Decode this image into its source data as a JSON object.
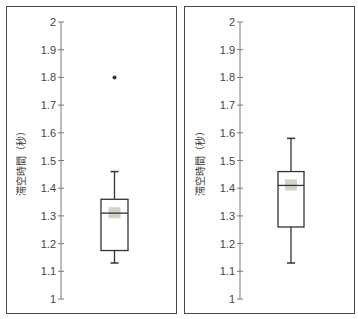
{
  "chart_data": [
    {
      "type": "box",
      "title": "",
      "xlabel": "",
      "ylabel": "滞空時間（秒）",
      "ylim": [
        1,
        2
      ],
      "yticks": [
        "1",
        "1.1",
        "1.2",
        "1.3",
        "1.4",
        "1.5",
        "1.6",
        "1.7",
        "1.8",
        "1.9",
        "2"
      ],
      "grid": false,
      "box": {
        "whisker_low": 1.13,
        "q1": 1.175,
        "median": 1.31,
        "mean": 1.31,
        "q3": 1.36,
        "whisker_high": 1.46,
        "outliers": [
          1.8
        ]
      }
    },
    {
      "type": "box",
      "title": "",
      "xlabel": "",
      "ylabel": "滞空時間（秒）",
      "ylim": [
        1,
        2
      ],
      "yticks": [
        "1",
        "1.1",
        "1.2",
        "1.3",
        "1.4",
        "1.5",
        "1.6",
        "1.7",
        "1.8",
        "1.9",
        "2"
      ],
      "grid": false,
      "box": {
        "whisker_low": 1.13,
        "q1": 1.26,
        "median": 1.41,
        "mean": 1.41,
        "q3": 1.46,
        "whisker_high": 1.58,
        "outliers": []
      }
    }
  ],
  "colors": {
    "axis": "#7a7a7a",
    "box_stroke": "#333333",
    "mean_marker": "#cfd3c8",
    "border": "#4a4a4a"
  }
}
